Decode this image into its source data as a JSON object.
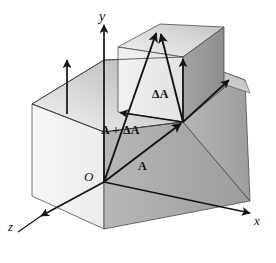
{
  "figure": {
    "kind": "3d-vector-diagram",
    "width": 276,
    "height": 263,
    "background_color": "#ffffff",
    "ink_color": "#141414"
  },
  "axes": {
    "y": {
      "label": "y",
      "origin": [
        104,
        182
      ],
      "tip": [
        104,
        25
      ]
    },
    "x": {
      "label": "x",
      "origin": [
        104,
        182
      ],
      "tip": [
        250,
        213
      ]
    },
    "z": {
      "label": "z",
      "origin": [
        104,
        182
      ],
      "tip": [
        18,
        232
      ]
    }
  },
  "origin": {
    "label": "O",
    "point": [
      104,
      182
    ]
  },
  "vectors": [
    {
      "name": "A",
      "label": "A",
      "from": [
        104,
        182
      ],
      "to": [
        183,
        122
      ],
      "label_pos": [
        138,
        160
      ]
    },
    {
      "name": "A-plus-delta-A",
      "label": "A + ΔA",
      "from": [
        104,
        182
      ],
      "to": [
        157,
        30
      ],
      "label_pos": [
        101,
        124
      ]
    },
    {
      "name": "delta-A",
      "label": "ΔA",
      "from": [
        183,
        122
      ],
      "to": [
        160,
        31
      ],
      "label_pos": [
        152,
        88
      ]
    }
  ],
  "guide_arrows": [
    {
      "name": "small-box-top-left-edge-arrow",
      "from": [
        183,
        122
      ],
      "to": [
        118,
        112
      ]
    },
    {
      "name": "small-box-right-vertical-arrow",
      "from": [
        183,
        122
      ],
      "to": [
        183,
        57
      ]
    },
    {
      "name": "big-box-top-vertical-arrow",
      "from": [
        67,
        114
      ],
      "to": [
        67,
        58
      ]
    },
    {
      "name": "big-box-top-right-edge-arrow",
      "from": [
        183,
        122
      ],
      "to": [
        231,
        78
      ]
    }
  ],
  "solid": {
    "name": "stepped-block",
    "faces": [
      {
        "name": "big-box-front-left-face",
        "fill": "#f2f2f2"
      },
      {
        "name": "big-box-front-right-face",
        "fill": "#aaaaaa"
      },
      {
        "name": "big-box-top-face",
        "fill": "#c9c9c9"
      },
      {
        "name": "small-box-front-left-face",
        "fill": "#ededed"
      },
      {
        "name": "small-box-front-right-face",
        "fill": "#989898"
      },
      {
        "name": "small-box-top-face",
        "fill": "#d6d6d6"
      }
    ]
  },
  "colors": {
    "ink": "#141414",
    "face_lightest": "#f2f2f2",
    "face_light": "#ededed",
    "face_top": "#c9c9c9",
    "face_top_small": "#d6d6d6",
    "face_mid": "#aaaaaa",
    "face_dark": "#989898",
    "page": "#ffffff"
  }
}
